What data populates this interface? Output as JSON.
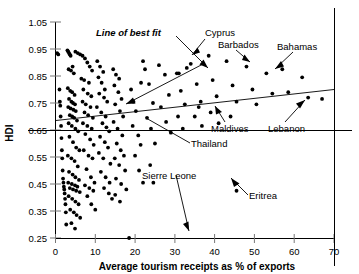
{
  "chart_data": {
    "type": "scatter",
    "title": "",
    "xlabel": "Average tourism receipts as % of exports",
    "ylabel": "HDI",
    "xlim": [
      0,
      70
    ],
    "ylim": [
      0.25,
      1.05
    ],
    "xticks": [
      0,
      10,
      20,
      30,
      40,
      50,
      60,
      70
    ],
    "xtick_labels": [
      "0",
      "10",
      "20",
      "30",
      "40",
      "50",
      "60",
      "70"
    ],
    "yticks": [
      0.25,
      0.35,
      0.45,
      0.55,
      0.65,
      0.75,
      0.85,
      0.95,
      1.05
    ],
    "ytick_labels": [
      "0.25",
      "0.35",
      "0.45",
      "0.55",
      "0.65",
      "0.75",
      "0.85",
      "0.95",
      "1.05"
    ],
    "grid": false,
    "legend": "none",
    "series": [
      {
        "name": "Countries",
        "marker": "filled-circle",
        "points": [
          [
            0.4,
            0.935
          ],
          [
            0.7,
            0.93
          ],
          [
            1.0,
            0.8
          ],
          [
            1.1,
            0.755
          ],
          [
            1.2,
            0.74
          ],
          [
            1.3,
            0.7
          ],
          [
            1.4,
            0.665
          ],
          [
            1.5,
            0.62
          ],
          [
            1.6,
            0.575
          ],
          [
            1.7,
            0.545
          ],
          [
            1.8,
            0.5
          ],
          [
            1.9,
            0.47
          ],
          [
            2.0,
            0.455
          ],
          [
            2.1,
            0.44
          ],
          [
            2.2,
            0.43
          ],
          [
            2.3,
            0.415
          ],
          [
            2.4,
            0.395
          ],
          [
            2.5,
            0.375
          ],
          [
            2.6,
            0.345
          ],
          [
            2.7,
            0.3
          ],
          [
            3.0,
            0.945
          ],
          [
            3.2,
            0.94
          ],
          [
            3.4,
            0.935
          ],
          [
            3.6,
            0.93
          ],
          [
            3.8,
            0.925
          ],
          [
            3.3,
            0.875
          ],
          [
            3.9,
            0.87
          ],
          [
            4.3,
            0.885
          ],
          [
            4.6,
            0.86
          ],
          [
            3.1,
            0.805
          ],
          [
            3.7,
            0.795
          ],
          [
            4.2,
            0.79
          ],
          [
            4.8,
            0.78
          ],
          [
            3.4,
            0.765
          ],
          [
            4.0,
            0.755
          ],
          [
            4.4,
            0.75
          ],
          [
            4.9,
            0.745
          ],
          [
            3.2,
            0.735
          ],
          [
            3.8,
            0.73
          ],
          [
            4.5,
            0.725
          ],
          [
            5.1,
            0.72
          ],
          [
            3.6,
            0.705
          ],
          [
            4.2,
            0.7
          ],
          [
            4.7,
            0.695
          ],
          [
            5.4,
            0.685
          ],
          [
            3.3,
            0.675
          ],
          [
            4.1,
            0.665
          ],
          [
            5.0,
            0.655
          ],
          [
            5.7,
            0.645
          ],
          [
            3.5,
            0.625
          ],
          [
            4.4,
            0.605
          ],
          [
            5.2,
            0.585
          ],
          [
            6.0,
            0.575
          ],
          [
            3.1,
            0.555
          ],
          [
            4.0,
            0.545
          ],
          [
            4.8,
            0.535
          ],
          [
            5.6,
            0.515
          ],
          [
            3.4,
            0.495
          ],
          [
            4.3,
            0.485
          ],
          [
            5.0,
            0.475
          ],
          [
            5.9,
            0.465
          ],
          [
            3.2,
            0.455
          ],
          [
            4.1,
            0.45
          ],
          [
            4.9,
            0.445
          ],
          [
            5.5,
            0.44
          ],
          [
            3.6,
            0.435
          ],
          [
            4.4,
            0.43
          ],
          [
            5.2,
            0.425
          ],
          [
            6.1,
            0.42
          ],
          [
            3.3,
            0.405
          ],
          [
            4.2,
            0.395
          ],
          [
            5.0,
            0.385
          ],
          [
            5.8,
            0.375
          ],
          [
            3.7,
            0.355
          ],
          [
            4.6,
            0.345
          ],
          [
            5.3,
            0.335
          ],
          [
            6.2,
            0.325
          ],
          [
            4.0,
            0.305
          ],
          [
            4.9,
            0.285
          ],
          [
            5.0,
            0.94
          ],
          [
            5.6,
            0.935
          ],
          [
            6.2,
            0.93
          ],
          [
            6.8,
            0.925
          ],
          [
            7.4,
            0.915
          ],
          [
            8.0,
            0.9
          ],
          [
            8.6,
            0.885
          ],
          [
            9.2,
            0.87
          ],
          [
            6.5,
            0.84
          ],
          [
            7.2,
            0.835
          ],
          [
            8.4,
            0.825
          ],
          [
            7.0,
            0.8
          ],
          [
            8.1,
            0.785
          ],
          [
            9.0,
            0.775
          ],
          [
            6.8,
            0.755
          ],
          [
            7.6,
            0.745
          ],
          [
            8.8,
            0.735
          ],
          [
            7.3,
            0.715
          ],
          [
            8.2,
            0.705
          ],
          [
            9.4,
            0.695
          ],
          [
            6.9,
            0.675
          ],
          [
            8.0,
            0.665
          ],
          [
            9.1,
            0.655
          ],
          [
            7.5,
            0.635
          ],
          [
            8.7,
            0.615
          ],
          [
            9.6,
            0.595
          ],
          [
            7.1,
            0.575
          ],
          [
            8.3,
            0.555
          ],
          [
            9.3,
            0.545
          ],
          [
            7.8,
            0.505
          ],
          [
            8.9,
            0.475
          ],
          [
            9.8,
            0.455
          ],
          [
            7.4,
            0.445
          ],
          [
            8.5,
            0.435
          ],
          [
            9.5,
            0.425
          ],
          [
            8.0,
            0.405
          ],
          [
            9.0,
            0.375
          ],
          [
            10.0,
            0.355
          ],
          [
            10.5,
            0.905
          ],
          [
            11.2,
            0.885
          ],
          [
            12.0,
            0.865
          ],
          [
            10.8,
            0.845
          ],
          [
            11.6,
            0.825
          ],
          [
            12.4,
            0.8
          ],
          [
            11.0,
            0.785
          ],
          [
            12.2,
            0.77
          ],
          [
            13.0,
            0.755
          ],
          [
            10.4,
            0.735
          ],
          [
            11.5,
            0.715
          ],
          [
            12.6,
            0.7
          ],
          [
            11.8,
            0.675
          ],
          [
            12.8,
            0.66
          ],
          [
            13.5,
            0.645
          ],
          [
            11.2,
            0.625
          ],
          [
            12.4,
            0.605
          ],
          [
            13.2,
            0.585
          ],
          [
            10.9,
            0.565
          ],
          [
            12.0,
            0.545
          ],
          [
            13.8,
            0.525
          ],
          [
            11.4,
            0.495
          ],
          [
            12.6,
            0.475
          ],
          [
            13.6,
            0.455
          ],
          [
            12.2,
            0.435
          ],
          [
            13.4,
            0.415
          ],
          [
            14.2,
            0.395
          ],
          [
            14.5,
            0.875
          ],
          [
            15.2,
            0.855
          ],
          [
            16.0,
            0.84
          ],
          [
            14.8,
            0.815
          ],
          [
            15.8,
            0.79
          ],
          [
            16.6,
            0.765
          ],
          [
            15.0,
            0.745
          ],
          [
            16.2,
            0.72
          ],
          [
            17.0,
            0.7
          ],
          [
            14.6,
            0.68
          ],
          [
            15.6,
            0.655
          ],
          [
            16.8,
            0.63
          ],
          [
            15.4,
            0.6
          ],
          [
            16.4,
            0.575
          ],
          [
            17.2,
            0.555
          ],
          [
            14.9,
            0.545
          ],
          [
            16.0,
            0.52
          ],
          [
            17.5,
            0.5
          ],
          [
            15.2,
            0.47
          ],
          [
            16.5,
            0.45
          ],
          [
            17.8,
            0.43
          ],
          [
            15.0,
            0.41
          ],
          [
            16.2,
            0.385
          ],
          [
            18.5,
            0.25
          ],
          [
            19.0,
            0.8
          ],
          [
            19.6,
            0.755
          ],
          [
            20.2,
            0.72
          ],
          [
            19.4,
            0.665
          ],
          [
            20.8,
            0.63
          ],
          [
            21.4,
            0.595
          ],
          [
            20.0,
            0.555
          ],
          [
            21.0,
            0.5
          ],
          [
            22.0,
            0.455
          ],
          [
            22.5,
            0.875
          ],
          [
            23.5,
            0.82
          ],
          [
            24.5,
            0.75
          ],
          [
            23.0,
            0.695
          ],
          [
            24.0,
            0.655
          ],
          [
            25.0,
            0.6
          ],
          [
            23.8,
            0.52
          ],
          [
            24.6,
            0.455
          ],
          [
            26.0,
            0.89
          ],
          [
            27.5,
            0.855
          ],
          [
            28.5,
            0.78
          ],
          [
            26.5,
            0.735
          ],
          [
            27.8,
            0.68
          ],
          [
            29.0,
            0.64
          ],
          [
            30.5,
            0.86
          ],
          [
            31.5,
            0.795
          ],
          [
            32.5,
            0.745
          ],
          [
            30.8,
            0.7
          ],
          [
            32.0,
            0.655
          ],
          [
            34.0,
            0.895
          ],
          [
            35.5,
            0.82
          ],
          [
            36.5,
            0.755
          ],
          [
            35.0,
            0.7
          ],
          [
            36.8,
            0.665
          ],
          [
            38.5,
            0.925
          ],
          [
            39.5,
            0.835
          ],
          [
            40.5,
            0.775
          ],
          [
            39.0,
            0.715
          ],
          [
            41.0,
            0.675
          ],
          [
            43.0,
            0.905
          ],
          [
            44.5,
            0.815
          ],
          [
            45.5,
            0.755
          ],
          [
            44.0,
            0.7
          ],
          [
            45.5,
            0.425
          ],
          [
            48.0,
            0.885
          ],
          [
            49.5,
            0.8
          ],
          [
            50.5,
            0.745
          ],
          [
            53.0,
            0.86
          ],
          [
            54.5,
            0.785
          ],
          [
            57.0,
            0.875
          ],
          [
            58.5,
            0.79
          ],
          [
            62.0,
            0.845
          ],
          [
            63.5,
            0.77
          ],
          [
            67.0,
            0.765
          ],
          [
            31.0,
            0.86
          ],
          [
            33.0,
            0.88
          ],
          [
            36.0,
            0.735
          ],
          [
            21.5,
            0.825
          ],
          [
            22.0,
            0.905
          ]
        ]
      }
    ],
    "fit_line": {
      "label": "Line of best fit",
      "x0": 0,
      "y0": 0.685,
      "x1": 70,
      "y1": 0.8
    },
    "reference_line": {
      "y": 0.65,
      "style": "solid"
    },
    "annotations": [
      {
        "label": "Line of best fit",
        "italic": true,
        "point": [
          34,
          0.755
        ]
      },
      {
        "label": "Cyprus",
        "point": [
          22.0,
          0.905
        ]
      },
      {
        "label": "Barbados",
        "point": [
          31.0,
          0.86
        ]
      },
      {
        "label": "Bahamas",
        "point": [
          45.5,
          0.84
        ]
      },
      {
        "label": "Maldives",
        "point": [
          33.5,
          0.7
        ]
      },
      {
        "label": "Lebanon",
        "point": [
          59.5,
          0.71
        ]
      },
      {
        "label": "Thailand",
        "point": [
          15.0,
          0.735
        ]
      },
      {
        "label": "Sierre Leone",
        "point": [
          18.5,
          0.25
        ]
      },
      {
        "label": "Eritrea",
        "point": [
          45.5,
          0.425
        ]
      }
    ]
  }
}
